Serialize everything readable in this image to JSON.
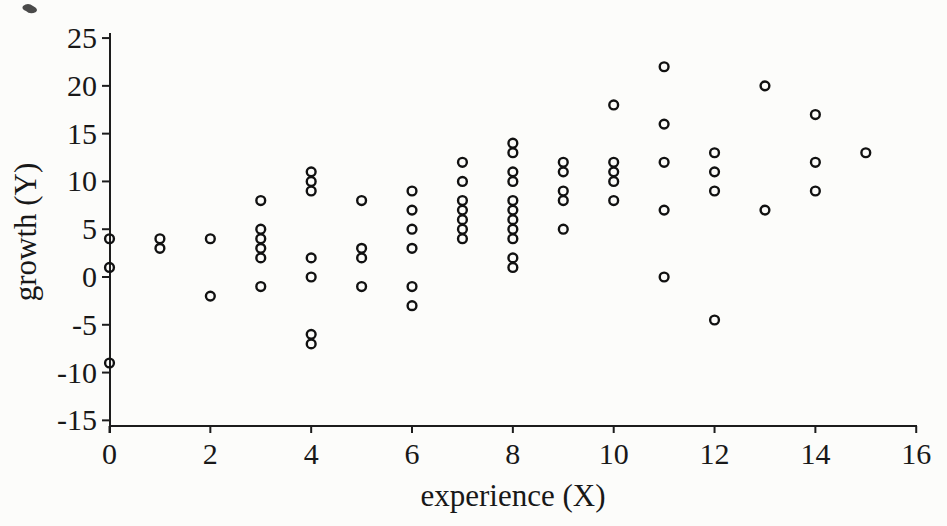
{
  "figure": {
    "background": "#fcfcfa",
    "ink": "#1c1c1c",
    "marker_color": "#111111"
  },
  "chart_data": {
    "type": "scatter",
    "title": "",
    "xlabel": "experience (X)",
    "ylabel": "growth (Y)",
    "xlim": [
      0,
      16
    ],
    "ylim": [
      -15,
      25
    ],
    "x_ticks": [
      0,
      2,
      4,
      6,
      8,
      10,
      12,
      14,
      16
    ],
    "y_ticks": [
      25,
      20,
      15,
      10,
      5,
      0,
      -5,
      -10,
      -15
    ],
    "grid": false,
    "legend": false,
    "marker": "open-circle",
    "points": [
      [
        0,
        4
      ],
      [
        0,
        1
      ],
      [
        0,
        -9
      ],
      [
        1,
        4
      ],
      [
        1,
        3
      ],
      [
        2,
        4
      ],
      [
        2,
        -2
      ],
      [
        3,
        8
      ],
      [
        3,
        5
      ],
      [
        3,
        4
      ],
      [
        3,
        3
      ],
      [
        3,
        2
      ],
      [
        3,
        -1
      ],
      [
        4,
        11
      ],
      [
        4,
        10
      ],
      [
        4,
        9
      ],
      [
        4,
        2
      ],
      [
        4,
        0
      ],
      [
        4,
        -6
      ],
      [
        4,
        -7
      ],
      [
        5,
        8
      ],
      [
        5,
        3
      ],
      [
        5,
        2
      ],
      [
        5,
        -1
      ],
      [
        6,
        9
      ],
      [
        6,
        7
      ],
      [
        6,
        5
      ],
      [
        6,
        3
      ],
      [
        6,
        -1
      ],
      [
        6,
        -3
      ],
      [
        7,
        12
      ],
      [
        7,
        10
      ],
      [
        7,
        8
      ],
      [
        7,
        7
      ],
      [
        7,
        6
      ],
      [
        7,
        5
      ],
      [
        7,
        4
      ],
      [
        8,
        14
      ],
      [
        8,
        13
      ],
      [
        8,
        11
      ],
      [
        8,
        10
      ],
      [
        8,
        8
      ],
      [
        8,
        7
      ],
      [
        8,
        6
      ],
      [
        8,
        5
      ],
      [
        8,
        4
      ],
      [
        8,
        2
      ],
      [
        8,
        1
      ],
      [
        9,
        12
      ],
      [
        9,
        11
      ],
      [
        9,
        9
      ],
      [
        9,
        8
      ],
      [
        9,
        5
      ],
      [
        10,
        18
      ],
      [
        10,
        12
      ],
      [
        10,
        11
      ],
      [
        10,
        10
      ],
      [
        10,
        8
      ],
      [
        11,
        22
      ],
      [
        11,
        16
      ],
      [
        11,
        12
      ],
      [
        11,
        7
      ],
      [
        11,
        0
      ],
      [
        12,
        13
      ],
      [
        12,
        11
      ],
      [
        12,
        9
      ],
      [
        12,
        -4.5
      ],
      [
        13,
        20
      ],
      [
        13,
        7
      ],
      [
        14,
        17
      ],
      [
        14,
        12
      ],
      [
        14,
        9
      ],
      [
        15,
        13
      ]
    ]
  }
}
